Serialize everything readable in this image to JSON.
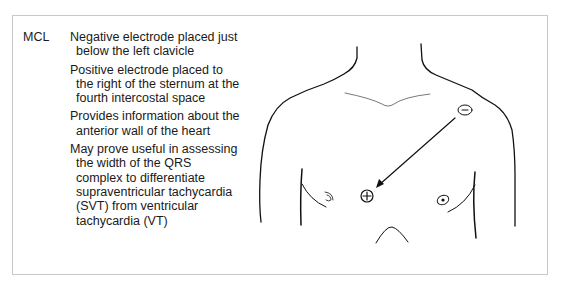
{
  "panel": {
    "lead_label": "MCL",
    "points": [
      "Negative electrode placed just below the left clavicle",
      "Positive electrode placed to the right of the sternum at the fourth intercostal space",
      "Provides information about the anterior wall of the heart",
      "May prove useful in assessing the width of the QRS complex to differentiate supraventricular tachycardia (SVT) from ventricular tachycardia (VT)"
    ]
  },
  "figure": {
    "negative_electrode": {
      "symbol": "−",
      "x": 465,
      "y": 110
    },
    "positive_electrode": {
      "symbol": "+",
      "x": 367,
      "y": 196
    },
    "arrow": {
      "from": [
        455,
        118
      ],
      "to": [
        376,
        187
      ]
    },
    "line_color": "#111111"
  }
}
